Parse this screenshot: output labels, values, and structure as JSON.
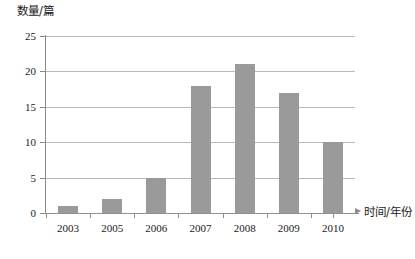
{
  "chart_data": {
    "type": "bar",
    "title": "",
    "subtitle": "",
    "xlabel": "时间/年份",
    "ylabel": "数量/篇",
    "categories": [
      "2003",
      "2005",
      "2006",
      "2007",
      "2008",
      "2009",
      "2010"
    ],
    "values": [
      1,
      2,
      5,
      18,
      21,
      17,
      10
    ],
    "series": [
      {
        "name": "数量/篇",
        "values": [
          1,
          2,
          5,
          18,
          21,
          17,
          10
        ]
      }
    ],
    "ylim": [
      0,
      25
    ],
    "yticks": [
      0,
      5,
      10,
      15,
      20,
      25
    ],
    "ytick_labels": [
      "0",
      "5",
      "10",
      "15",
      "20",
      "25"
    ],
    "grid": "horizontal",
    "legend": "none",
    "bar_color": "#9a9a9a",
    "grid_color": "#b9b9b9",
    "axis_color": "#8b8b8b",
    "background": "#ffffff"
  }
}
